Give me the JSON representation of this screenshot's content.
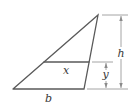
{
  "diagram": {
    "type": "trapezoid-in-triangle",
    "labels": {
      "top_segment": "x",
      "base": "b",
      "total_height": "h",
      "lower_height": "y"
    },
    "colors": {
      "shape": "#5a5a5a",
      "dimension": "#9a9a9a",
      "label": "#3a3a3a"
    }
  }
}
